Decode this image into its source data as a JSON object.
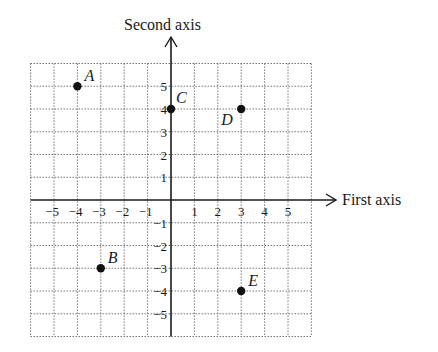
{
  "chart_data": {
    "type": "scatter",
    "title": "",
    "xlabel": "First axis",
    "ylabel": "Second axis",
    "xlim": [
      -6,
      6
    ],
    "ylim": [
      -6,
      6
    ],
    "grid": true,
    "x_ticks": [
      "-5",
      "-4",
      "-3",
      "-2",
      "-1",
      "1",
      "2",
      "3",
      "4",
      "5"
    ],
    "y_ticks": [
      "5",
      "4",
      "3",
      "2",
      "1",
      "-1",
      "-2",
      "-3",
      "-4",
      "-5"
    ],
    "points": [
      {
        "label": "A",
        "x": -4,
        "y": 5
      },
      {
        "label": "B",
        "x": -3,
        "y": -3
      },
      {
        "label": "C",
        "x": 0,
        "y": 4
      },
      {
        "label": "D",
        "x": 3,
        "y": 4
      },
      {
        "label": "E",
        "x": 3,
        "y": -4
      }
    ]
  },
  "colors": {
    "axis": "#1a1a1a",
    "grid": "#555555",
    "point": "#111111",
    "background": "#ffffff"
  }
}
